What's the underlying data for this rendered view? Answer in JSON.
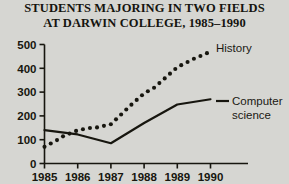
{
  "title": {
    "line1": "STUDENTS MAJORING IN TWO FIELDS",
    "line2": "AT DARWIN COLLEGE, 1985–1990"
  },
  "legend": {
    "history_label": "History",
    "computer_label_line1": "Computer",
    "computer_label_line2": "science"
  },
  "axis": {
    "y_ticks": [
      "0",
      "100",
      "200",
      "300",
      "400",
      "500"
    ],
    "x_ticks": [
      "1985",
      "1986",
      "1987",
      "1988",
      "1989",
      "1990"
    ]
  },
  "colors": {
    "background": "#d6d6d2",
    "ink": "#17160f",
    "line": "#15140f"
  },
  "chart_data": {
    "type": "line",
    "xlabel": "",
    "ylabel": "",
    "x": [
      1985,
      1986,
      1987,
      1988,
      1989,
      1990
    ],
    "categories": [
      "1985",
      "1986",
      "1987",
      "1988",
      "1989",
      "1990"
    ],
    "ylim": [
      0,
      500
    ],
    "xlim": [
      1985,
      1990
    ],
    "yticks": [
      0,
      100,
      200,
      300,
      400,
      500
    ],
    "grid": false,
    "legend_position": "right-inline",
    "series": [
      {
        "name": "History",
        "style": "dotted",
        "values": [
          70,
          130,
          165,
          295,
          405,
          470
        ],
        "points": [
          {
            "x": 1985.0,
            "y": 70
          },
          {
            "x": 1985.2,
            "y": 85
          },
          {
            "x": 1985.4,
            "y": 100
          },
          {
            "x": 1985.6,
            "y": 118
          },
          {
            "x": 1985.8,
            "y": 128
          },
          {
            "x": 1986.0,
            "y": 140
          },
          {
            "x": 1986.3,
            "y": 148
          },
          {
            "x": 1986.6,
            "y": 152
          },
          {
            "x": 1987.0,
            "y": 165
          },
          {
            "x": 1987.3,
            "y": 205
          },
          {
            "x": 1987.6,
            "y": 245
          },
          {
            "x": 1988.0,
            "y": 295
          },
          {
            "x": 1988.3,
            "y": 318
          },
          {
            "x": 1988.6,
            "y": 355
          },
          {
            "x": 1989.0,
            "y": 405
          },
          {
            "x": 1989.5,
            "y": 440
          },
          {
            "x": 1990.0,
            "y": 470
          }
        ]
      },
      {
        "name": "Computer science",
        "style": "solid",
        "values": [
          140,
          122,
          85,
          170,
          248,
          270
        ],
        "points": [
          {
            "x": 1985.0,
            "y": 140
          },
          {
            "x": 1986.0,
            "y": 122
          },
          {
            "x": 1987.0,
            "y": 85
          },
          {
            "x": 1988.0,
            "y": 170
          },
          {
            "x": 1989.0,
            "y": 248
          },
          {
            "x": 1990.0,
            "y": 270
          }
        ]
      }
    ]
  }
}
